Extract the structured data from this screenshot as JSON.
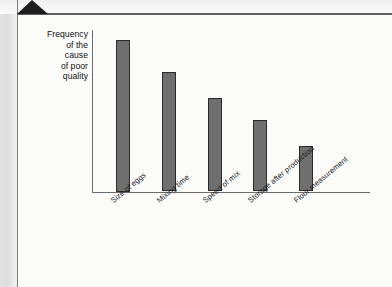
{
  "page": {
    "background_color": "#fbfbfa",
    "frame_color": "#7b7b7b",
    "corner_marker_color": "#1d1d1d"
  },
  "chart_data": {
    "type": "bar",
    "title": "",
    "subtitle": "",
    "xlabel": "",
    "ylabel": "Frequency of the cause of poor quality",
    "ylabel_lines": [
      "Frequency",
      "of the",
      "cause",
      "of poor",
      "quality"
    ],
    "categories": [
      "Size of eggs",
      "Mixing time",
      "Speed of mix",
      "Storage after production",
      "Flour measurement"
    ],
    "values": [
      100,
      79,
      62,
      47,
      30
    ],
    "ylim": [
      0,
      105
    ],
    "grid": false,
    "legend": null,
    "axis_ticks": [],
    "bar_color": "#6f6f6f",
    "bar_edge_color": "#2a2a2a",
    "axis_color": "#6b6b6b",
    "label_rotation_deg": -40
  }
}
